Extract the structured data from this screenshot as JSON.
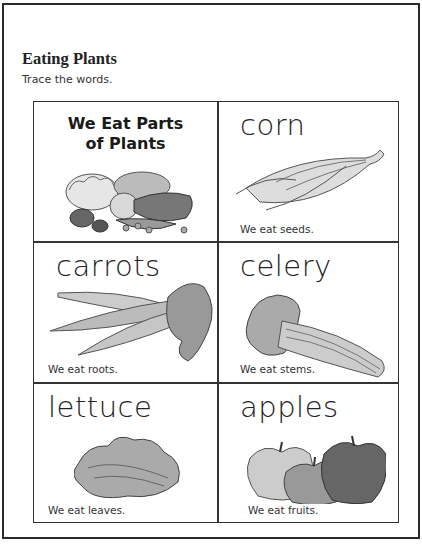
{
  "header": {
    "title": "Eating Plants",
    "instruction": "Trace the words."
  },
  "grid": {
    "intro": {
      "line1": "We Eat Parts",
      "line2": "of Plants",
      "image": "assorted-vegetables-illustration"
    },
    "cells": [
      {
        "word": "corn",
        "caption": "We eat seeds.",
        "image": "corn-illustration"
      },
      {
        "word": "carrots",
        "caption": "We eat roots.",
        "image": "carrots-illustration"
      },
      {
        "word": "celery",
        "caption": "We eat stems.",
        "image": "celery-illustration"
      },
      {
        "word": "lettuce",
        "caption": "We eat leaves.",
        "image": "lettuce-illustration"
      },
      {
        "word": "apples",
        "caption": "We eat fruits.",
        "image": "apples-illustration"
      }
    ]
  }
}
